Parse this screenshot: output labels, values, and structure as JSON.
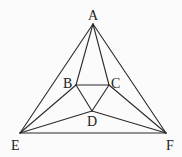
{
  "diagram": {
    "type": "geometry-figure",
    "points": [
      {
        "id": "A",
        "label": "A"
      },
      {
        "id": "B",
        "label": "B"
      },
      {
        "id": "C",
        "label": "C"
      },
      {
        "id": "D",
        "label": "D"
      },
      {
        "id": "E",
        "label": "E"
      },
      {
        "id": "F",
        "label": "F"
      }
    ],
    "segments": [
      [
        "A",
        "E"
      ],
      [
        "A",
        "F"
      ],
      [
        "E",
        "F"
      ],
      [
        "A",
        "B"
      ],
      [
        "A",
        "C"
      ],
      [
        "B",
        "C"
      ],
      [
        "B",
        "D"
      ],
      [
        "C",
        "D"
      ],
      [
        "E",
        "B"
      ],
      [
        "E",
        "D"
      ],
      [
        "F",
        "C"
      ],
      [
        "F",
        "D"
      ]
    ]
  }
}
